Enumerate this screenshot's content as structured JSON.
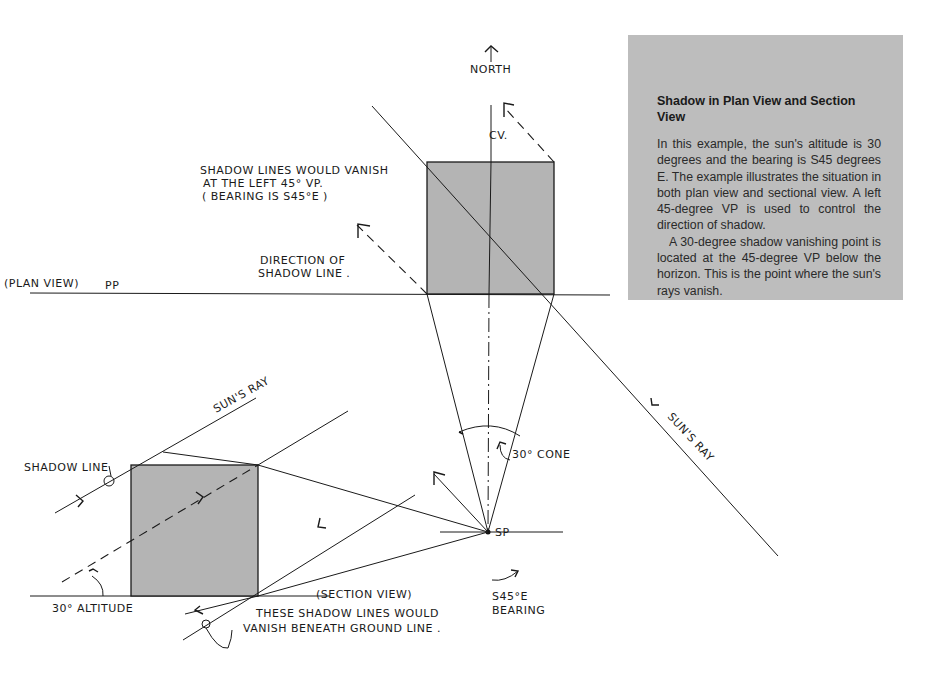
{
  "info_box": {
    "title": "Shadow in Plan View and Section View",
    "paragraph_1": "In this example, the sun's altitude is 30 degrees and the bearing is S45 degrees E. The example illustrates the situation in both plan view and sectional view. A left 45-degree VP is used to control the direction of shadow.",
    "paragraph_2": "A 30-degree shadow vanishing point is located at the 45-degree VP below the horizon. This is the point where the sun's rays vanish.",
    "background_color": "#bdbdbd"
  },
  "labels": {
    "north": "NORTH",
    "cv": "CV.",
    "shadow_note_1": "SHADOW LINES WOULD VANISH",
    "shadow_note_2": "AT THE LEFT 45° VP.",
    "shadow_note_3": "( BEARING IS S45°E )",
    "direction_1": "DIRECTION OF",
    "direction_2": "SHADOW LINE .",
    "plan_view": "(PLAN VIEW)",
    "pp": "PP",
    "suns_ray_right": "SUN'S RAY",
    "suns_ray_left": "SUN'S RAY",
    "shadow_line": "SHADOW LINE",
    "thirty_cone": "30° CONE",
    "sp": "SP",
    "altitude": "30° ALTITUDE",
    "section_view": "(SECTION VIEW)",
    "ground_note_1": "THESE SHADOW LINES WOULD",
    "ground_note_2": "VANISH BENEATH GROUND LINE .",
    "bearing_1": "S45°E",
    "bearing_2": "BEARING"
  },
  "colors": {
    "box_fill": "#b4b4b4",
    "ink": "#1a1a1a"
  }
}
